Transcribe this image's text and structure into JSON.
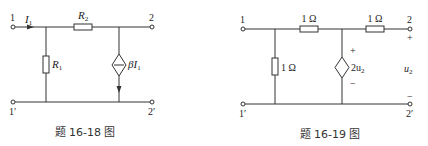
{
  "figures": [
    {
      "id": "fig-16-18",
      "caption": "题 16-18 图",
      "terminals": {
        "p1": "1",
        "p1p": "1′",
        "p2": "2",
        "p2p": "2′"
      },
      "current_label": "I",
      "current_sub": "1",
      "components": {
        "r_series": {
          "name": "R",
          "sub": "2"
        },
        "r_shunt": {
          "name": "R",
          "sub": "1"
        },
        "dep_source": {
          "prefix": "βI",
          "sub": "1",
          "type": "current-controlled current source"
        }
      }
    },
    {
      "id": "fig-16-19",
      "caption": "题 16-19 图",
      "terminals": {
        "p1": "1",
        "p1p": "1′",
        "p2": "2",
        "p2p": "2′"
      },
      "components": {
        "r_series_1": {
          "value": "1 Ω"
        },
        "r_series_2": {
          "value": "1 Ω"
        },
        "r_shunt": {
          "value": "1 Ω"
        },
        "dep_source": {
          "prefix": "2u",
          "sub": "2",
          "type": "voltage-controlled voltage source",
          "plus": "+",
          "minus": "−"
        }
      },
      "output_voltage": {
        "name": "u",
        "sub": "2",
        "plus": "+",
        "minus": "−"
      }
    }
  ]
}
